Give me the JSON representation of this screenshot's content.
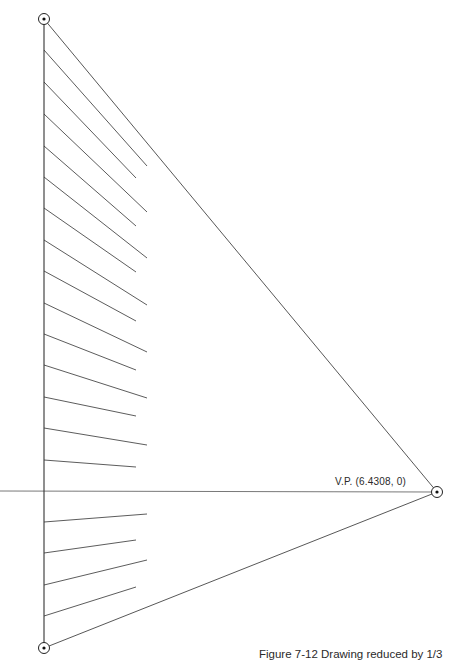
{
  "figure": {
    "caption": "Figure 7-12  Drawing reduced by 1/3",
    "vp_label": "V.P. (6.4308, 0)"
  },
  "chart_data": {
    "type": "diagram",
    "title": "Figure 7-12  Drawing reduced by 1/3",
    "points": {
      "top": [
        44,
        19
      ],
      "bottom": [
        44,
        648
      ],
      "vanishing_point": [
        437,
        492
      ],
      "vanishing_point_label": "V.P. (6.4308, 0)"
    },
    "horizon": {
      "y": 491,
      "x1": 0,
      "x2": 437
    },
    "vertical_edge": {
      "x": 44,
      "y1": 19,
      "y2": 648
    },
    "rays": [
      {
        "from": [
          44,
          19
        ],
        "to": [
          437,
          492
        ]
      },
      {
        "from": [
          44,
          648
        ],
        "to": [
          437,
          492
        ]
      }
    ],
    "construction_lines": [
      {
        "y_start": 50,
        "end": [
          147,
          166
        ]
      },
      {
        "y_start": 82,
        "end": [
          136,
          178
        ]
      },
      {
        "y_start": 114,
        "end": [
          147,
          212
        ]
      },
      {
        "y_start": 146,
        "end": [
          136,
          226
        ]
      },
      {
        "y_start": 177,
        "end": [
          147,
          258
        ]
      },
      {
        "y_start": 208,
        "end": [
          136,
          272
        ]
      },
      {
        "y_start": 240,
        "end": [
          147,
          305
        ]
      },
      {
        "y_start": 271,
        "end": [
          136,
          321
        ]
      },
      {
        "y_start": 303,
        "end": [
          147,
          352
        ]
      },
      {
        "y_start": 334,
        "end": [
          136,
          370
        ]
      },
      {
        "y_start": 365,
        "end": [
          147,
          398
        ]
      },
      {
        "y_start": 397,
        "end": [
          136,
          416
        ]
      },
      {
        "y_start": 428,
        "end": [
          147,
          445
        ]
      },
      {
        "y_start": 460,
        "end": [
          136,
          467
        ]
      },
      {
        "y_start": 522,
        "end": [
          147,
          514
        ]
      },
      {
        "y_start": 553,
        "end": [
          136,
          540
        ]
      },
      {
        "y_start": 585,
        "end": [
          147,
          560
        ]
      },
      {
        "y_start": 616,
        "end": [
          136,
          587
        ]
      }
    ],
    "stroke_color": "#3a3a3a"
  }
}
